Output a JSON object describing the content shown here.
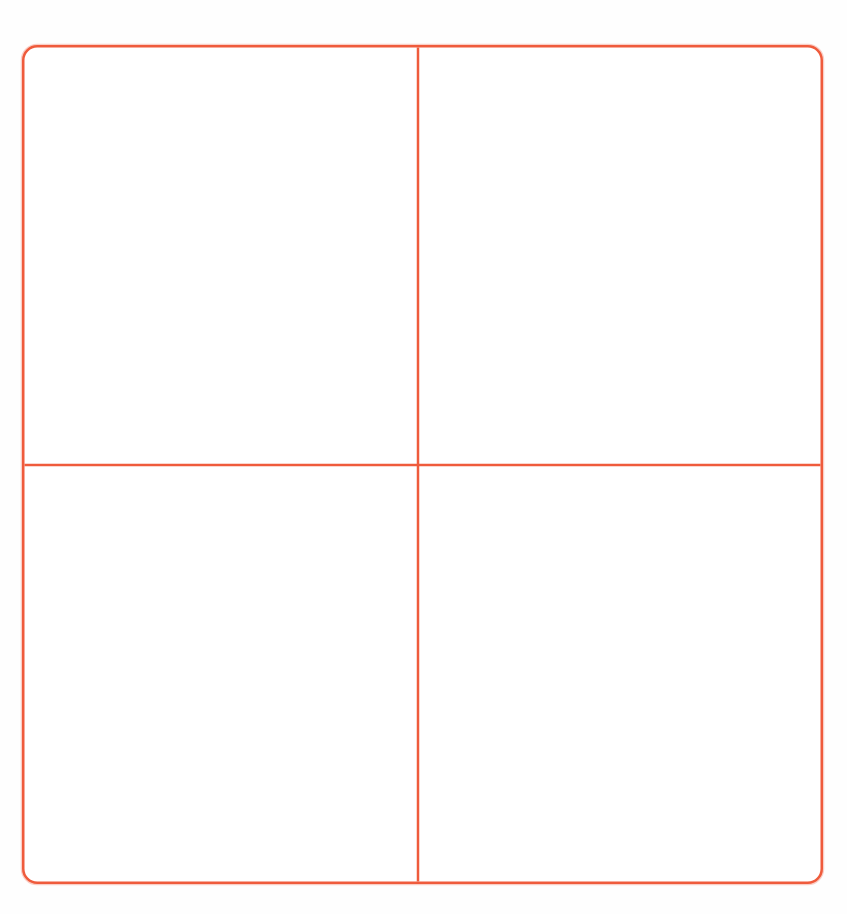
{
  "document": {
    "kind": "four-quadrant-grid-worksheet",
    "orientation": "portrait",
    "page_background_color": "#fefefe"
  },
  "frame": {
    "stroke_color": "#ef5b3c",
    "stroke_color_light": "#f4826b",
    "stroke_width_px": 2.5,
    "corner_radius_px": 14,
    "fill_color": "#ffffff",
    "left_px": 22,
    "top_px": 45,
    "width_px": 801,
    "height_px": 839
  },
  "dividers": {
    "vertical": {
      "label": "vertical-divider",
      "x_px": 396,
      "stroke_color": "#ef5b3c",
      "stroke_width_px": 2.5
    },
    "horizontal": {
      "label": "horizontal-divider",
      "y_px": 420,
      "stroke_color": "#ef5b3c",
      "stroke_width_px": 2.5
    }
  },
  "quadrants": [
    {
      "id": "top-left",
      "position": "top-left",
      "text": ""
    },
    {
      "id": "top-right",
      "position": "top-right",
      "text": ""
    },
    {
      "id": "bottom-left",
      "position": "bottom-left",
      "text": ""
    },
    {
      "id": "bottom-right",
      "position": "bottom-right",
      "text": ""
    }
  ]
}
